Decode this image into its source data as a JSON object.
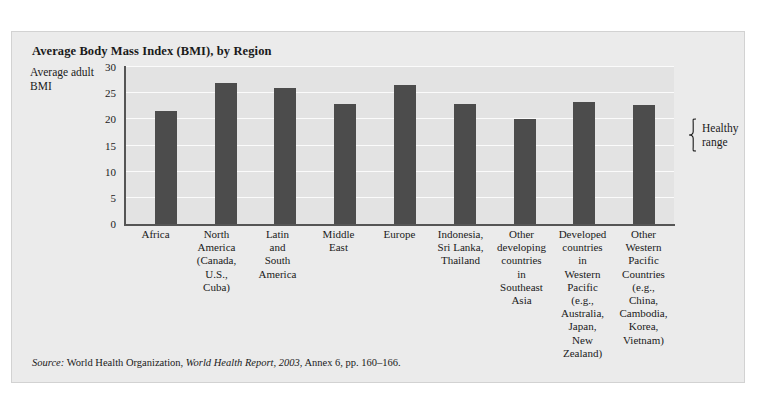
{
  "chart_data": {
    "type": "bar",
    "title": "Average Body Mass Index (BMI), by Region",
    "xlabel": "",
    "ylabel": "Average adult BMI",
    "ylim": [
      0,
      30
    ],
    "yticks": [
      0,
      5,
      10,
      15,
      20,
      25,
      30
    ],
    "grid": true,
    "legend": "none",
    "categories": [
      "Africa",
      "North America (Canada, U.S., Cuba)",
      "Latin and South America",
      "Middle East",
      "Europe",
      "Indonesia, Sri Lanka, Thailand",
      "Other developing countries in Southeast Asia",
      "Developed countries in Western Pacific (e.g., Australia, Japan, New Zealand)",
      "Other Western Pacific Countries (e.g., China, Cambodia, Korea, Vietnam)"
    ],
    "category_lines": [
      "Africa",
      "North\nAmerica\n(Canada,\nU.S.,\nCuba)",
      "Latin\nand\nSouth\nAmerica",
      "Middle\nEast",
      "Europe",
      "Indonesia,\nSri Lanka,\nThailand",
      "Other\ndeveloping\ncountries\nin\nSoutheast\nAsia",
      "Developed\ncountries\nin\nWestern\nPacific\n(e.g.,\nAustralia,\nJapan,\nNew\nZealand)",
      "Other\nWestern\nPacific\nCountries\n(e.g.,\nChina,\nCambodia,\nKorea,\nVietnam)"
    ],
    "values": [
      21.5,
      27.0,
      26.0,
      23.0,
      26.5,
      23.0,
      20.0,
      23.3,
      22.7
    ],
    "annotations": [
      {
        "name": "healthy-range",
        "label": "Healthy\nrange",
        "range": [
          22,
          25
        ]
      }
    ],
    "colors": {
      "bar": "#4c4c4c",
      "plot_background": "#e3e3e3",
      "gridline": "#fbfbfb",
      "axis": "#555555",
      "card_background": "#ebebeb",
      "card_topbar": "#6f6f6f",
      "text": "#1a1a1a"
    }
  },
  "source": {
    "prefix": "Source:",
    "publisher": "World Health Organization,",
    "report": "World Health Report, 2003,",
    "detail": "Annex 6, pp. 160–166."
  }
}
